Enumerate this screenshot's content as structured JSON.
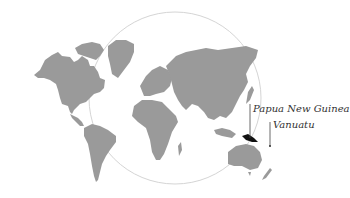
{
  "map": {
    "type": "world-map",
    "land_color": "#9a9a9a",
    "highlight_color": "#111111",
    "circle_color": "#cccccc",
    "labels": [
      {
        "name": "papua-new-guinea",
        "text": "Papua New Guinea"
      },
      {
        "name": "vanuatu",
        "text": "Vanuatu"
      }
    ]
  }
}
